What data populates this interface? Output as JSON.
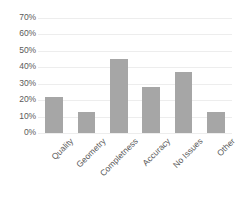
{
  "chart_data": {
    "type": "bar",
    "title": "",
    "xlabel": "",
    "ylabel": "",
    "categories": [
      "Quality",
      "Geometry",
      "Completness",
      "Accuracy",
      "No Issues",
      "Other"
    ],
    "values": [
      22,
      13,
      45,
      28,
      37,
      12.5
    ],
    "ylim": [
      0,
      70
    ],
    "ytick_values": [
      0,
      10,
      20,
      30,
      40,
      50,
      60,
      70
    ],
    "ytick_labels": [
      "0%",
      "10%",
      "20%",
      "30%",
      "40%",
      "50%",
      "60%",
      "70%"
    ],
    "grid": true,
    "grid_axis": "y",
    "legend": false,
    "legend_position": "none",
    "bar_color": "#a6a6a6",
    "gridline_color": "#ededed",
    "text_color": "#5a5a5a",
    "background_color": "#ffffff",
    "xtick_label_rotation": -45
  }
}
